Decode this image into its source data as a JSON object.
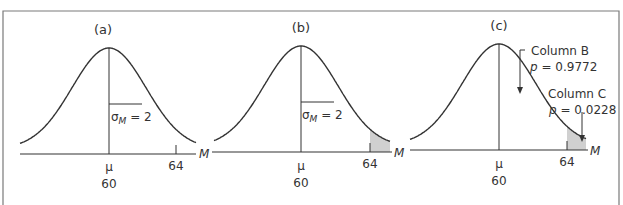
{
  "figure": {
    "frame_color": "#7a7a7a",
    "line_color": "#333333",
    "shade_color": "#d0d0d0",
    "panels": [
      {
        "id": "a",
        "label": "(a)",
        "mean_symbol": "μ",
        "mean_value": "60",
        "tick_value": "64",
        "axis_label": "M",
        "sigma_label": "σ",
        "sigma_sub": "M",
        "sigma_eq": " = 2",
        "shaded_tail": false
      },
      {
        "id": "b",
        "label": "(b)",
        "mean_symbol": "μ",
        "mean_value": "60",
        "tick_value": "64",
        "axis_label": "M",
        "sigma_label": "σ",
        "sigma_sub": "M",
        "sigma_eq": " = 2",
        "shaded_tail": true
      },
      {
        "id": "c",
        "label": "(c)",
        "mean_symbol": "μ",
        "mean_value": "60",
        "tick_value": "64",
        "axis_label": "M",
        "shaded_tail": true,
        "annotations": [
          {
            "title": "Column B",
            "p_label": "p",
            "p_value": " = 0.9772"
          },
          {
            "title": "Column C",
            "p_label": "p",
            "p_value": " = 0.0228"
          }
        ]
      }
    ]
  }
}
